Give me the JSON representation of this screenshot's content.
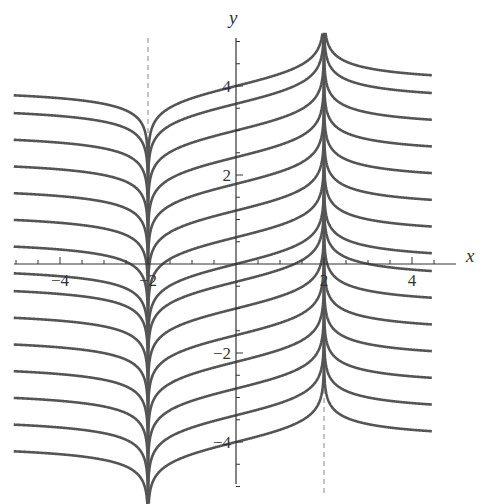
{
  "chart_data": {
    "type": "line",
    "title": "",
    "xlabel": "x",
    "ylabel": "y",
    "xlim": [
      -5.1,
      5.1
    ],
    "ylim": [
      -5.1,
      5.2
    ],
    "x_ticks": [
      -4,
      -2,
      2,
      4
    ],
    "x_tick_labels": [
      "-4",
      "-2",
      "2",
      "4"
    ],
    "y_ticks": [
      -4,
      -2,
      2,
      4
    ],
    "y_tick_labels": [
      "-4",
      "-2",
      "2",
      "4"
    ],
    "grid": false,
    "asymptotes": [
      {
        "x": -2,
        "style": "dashed"
      },
      {
        "x": 2,
        "style": "dashed"
      }
    ],
    "family": "y = C + 0.25*ln|(x+2)/(x-2)|",
    "C_values": [
      -4.0,
      -3.4,
      -2.8,
      -2.2,
      -1.6,
      -1.0,
      -0.4,
      0.0,
      0.6,
      1.2,
      1.8,
      2.4,
      3.0,
      3.6,
      4.0
    ],
    "series_count": 15
  },
  "axes": {
    "x_label": "x",
    "y_label": "y"
  },
  "colors": {
    "curve": "#555555",
    "axis": "#333333",
    "asymptote": "#888888"
  }
}
